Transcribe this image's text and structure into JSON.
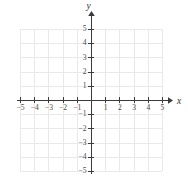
{
  "figure": {
    "type": "coordinate-plane",
    "width": 188,
    "height": 192,
    "background_color": "#ffffff",
    "grid_color": "#e9e9e9",
    "axis_color": "#3b3b3b",
    "label_color": "#4a4a4a"
  },
  "axes": {
    "x_axis_label": "x",
    "y_axis_label": "y",
    "origin_label": "",
    "x_range": [
      -5.5,
      5.5
    ],
    "y_range": [
      -5.5,
      5.5
    ],
    "unit_px": 14.2,
    "origin_px": {
      "x": 91,
      "y": 100
    },
    "grid": true,
    "arrows": [
      "x-positive",
      "y-positive"
    ]
  },
  "chart_data": {
    "type": "scatter",
    "title": "",
    "subtitle": "",
    "xlabel": "x",
    "ylabel": "y",
    "xlim": [
      -5.5,
      5.5
    ],
    "ylim": [
      -5.5,
      5.5
    ],
    "grid": true,
    "legend": false,
    "legend_position": "none",
    "x_ticks": [
      -5,
      -4,
      -3,
      -2,
      -1,
      1,
      2,
      3,
      4,
      5
    ],
    "y_ticks": [
      -5,
      -4,
      -3,
      -2,
      -1,
      1,
      2,
      3,
      4,
      5
    ],
    "x_tick_labels": [
      "−5",
      "−4",
      "−3",
      "−2",
      "−1",
      "1",
      "2",
      "3",
      "4",
      "5"
    ],
    "y_tick_labels": [
      "−5",
      "−4",
      "−3",
      "−2",
      "−1",
      "1",
      "2",
      "3",
      "4",
      "5"
    ],
    "gridlines_x": [
      -5,
      -4,
      -3,
      -2,
      -1,
      0,
      1,
      2,
      3,
      4,
      5
    ],
    "gridlines_y": [
      -5,
      -4,
      -3,
      -2,
      -1,
      0,
      1,
      2,
      3,
      4,
      5
    ],
    "series": [],
    "values": [],
    "annotations": []
  }
}
